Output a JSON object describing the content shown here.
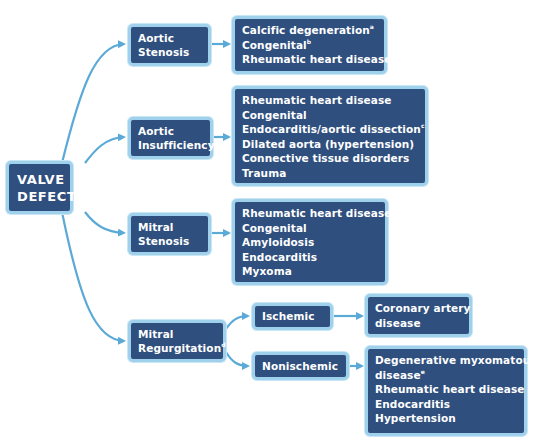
{
  "root": {
    "lines": [
      "VALVE",
      "DEFECT"
    ]
  },
  "colors": {
    "box_fill": "#2f4f7f",
    "box_border": "#9fd0ec",
    "arrow": "#5aa9d6",
    "text": "#ffffff"
  },
  "branches": [
    {
      "label_lines": [
        "Aortic",
        "Stenosis"
      ],
      "causes": [
        {
          "text": "Calcific degeneration",
          "sup": "a"
        },
        {
          "text": "Congenital",
          "sup": "b"
        },
        {
          "text": "Rheumatic heart disease",
          "sup": ""
        }
      ]
    },
    {
      "label_lines": [
        "Aortic",
        "Insufficiency"
      ],
      "causes": [
        {
          "text": "Rheumatic heart disease",
          "sup": ""
        },
        {
          "text": "Congenital",
          "sup": ""
        },
        {
          "text": "Endocarditis/aortic dissection",
          "sup": "c"
        },
        {
          "text": "Dilated aorta (hypertension)",
          "sup": ""
        },
        {
          "text": "Connective tissue disorders",
          "sup": ""
        },
        {
          "text": "Trauma",
          "sup": ""
        }
      ]
    },
    {
      "label_lines": [
        "Mitral",
        "Stenosis"
      ],
      "causes": [
        {
          "text": "Rheumatic heart disease",
          "sup": ""
        },
        {
          "text": "Congenital",
          "sup": ""
        },
        {
          "text": "Amyloidosis",
          "sup": ""
        },
        {
          "text": "Endocarditis",
          "sup": ""
        },
        {
          "text": "Myxoma",
          "sup": ""
        }
      ]
    },
    {
      "label_lines": [
        "Mitral",
        "Regurgitation"
      ],
      "label_sup": "d",
      "sub_branches": [
        {
          "label": "Ischemic",
          "causes": [
            {
              "text": "Coronary artery",
              "sup": ""
            },
            {
              "text": "disease",
              "sup": ""
            }
          ]
        },
        {
          "label": "Nonischemic",
          "causes": [
            {
              "text": "Degenerative myxomatous",
              "sup": ""
            },
            {
              "text": "disease",
              "sup": "e"
            },
            {
              "text": "Rheumatic heart disease",
              "sup": ""
            },
            {
              "text": "Endocarditis",
              "sup": ""
            },
            {
              "text": "Hypertension",
              "sup": ""
            }
          ]
        }
      ]
    }
  ]
}
